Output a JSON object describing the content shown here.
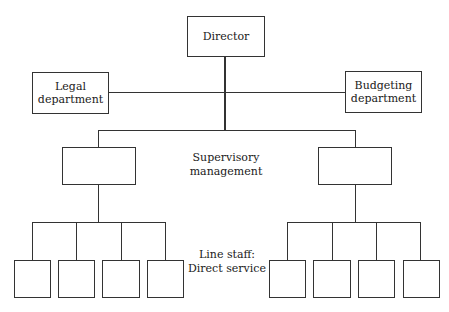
{
  "diagram": {
    "type": "org-chart",
    "nodes": {
      "director": {
        "label": "Director"
      },
      "legal": {
        "lines": [
          "Legal",
          "department"
        ]
      },
      "budgeting": {
        "lines": [
          "Budgeting",
          "department"
        ]
      },
      "supervisory_left": {
        "label": ""
      },
      "supervisory_right": {
        "label": ""
      },
      "line_staff_left": [
        {
          "label": ""
        },
        {
          "label": ""
        },
        {
          "label": ""
        },
        {
          "label": ""
        }
      ],
      "line_staff_right": [
        {
          "label": ""
        },
        {
          "label": ""
        },
        {
          "label": ""
        },
        {
          "label": ""
        }
      ]
    },
    "level_labels": {
      "supervisory": [
        "Supervisory",
        "management"
      ],
      "line_staff": [
        "Line staff:",
        "Direct service"
      ]
    },
    "edges": [
      [
        "director",
        "legal"
      ],
      [
        "director",
        "budgeting"
      ],
      [
        "director",
        "supervisory_left"
      ],
      [
        "director",
        "supervisory_right"
      ],
      [
        "supervisory_left",
        "line_staff_left"
      ],
      [
        "supervisory_right",
        "line_staff_right"
      ]
    ],
    "colors": {
      "line": "#333333",
      "background": "#ffffff",
      "text": "#1a1a1a"
    }
  }
}
